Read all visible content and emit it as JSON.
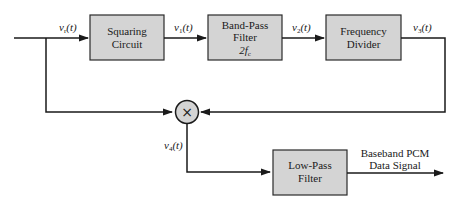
{
  "diagram": {
    "type": "block-diagram",
    "blocks": [
      {
        "id": "squaring",
        "line1": "Squaring",
        "line2": "Circuit"
      },
      {
        "id": "bandpass",
        "line1": "Band-Pass",
        "line2": "Filter",
        "line3": "2f",
        "line3_sub": "c"
      },
      {
        "id": "divider",
        "line1": "Frequency",
        "line2": "Divider"
      },
      {
        "id": "lowpass",
        "line1": "Low-Pass",
        "line2": "Filter"
      }
    ],
    "multiplier": {
      "symbol": "×"
    },
    "signals": {
      "vr": {
        "base": "v",
        "sub": "r",
        "arg": "(t)"
      },
      "v1": {
        "base": "v",
        "sub": "1",
        "arg": "(t)"
      },
      "v2": {
        "base": "v",
        "sub": "2",
        "arg": "(t)"
      },
      "v3": {
        "base": "v",
        "sub": "3",
        "arg": "(t)"
      },
      "v4": {
        "base": "v",
        "sub": "4",
        "arg": "(t)"
      }
    },
    "output": {
      "line1": "Baseband PCM",
      "line2": "Data Signal"
    }
  }
}
